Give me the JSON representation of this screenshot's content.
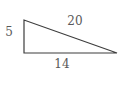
{
  "diagram": {
    "type": "right-triangle",
    "labels": {
      "left_side": "5",
      "hypotenuse": "20",
      "bottom_side": "14"
    },
    "colors": {
      "line": "#3d3d3d",
      "text": "#595959",
      "background": "#ffffff"
    }
  }
}
